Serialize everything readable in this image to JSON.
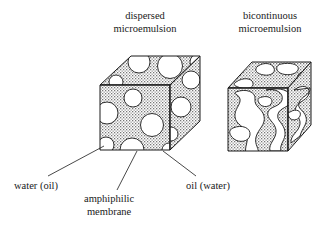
{
  "figure": {
    "background_color": "#ffffff",
    "ink_color": "#1a1a1a",
    "fill_texture": "stipple-dots",
    "fill_color": "#d8d8d8"
  },
  "titles": {
    "left": "dispersed\nmicroemulsion",
    "right": "bicontinuous\nmicroemulsion"
  },
  "labels": {
    "water": "water (oil)",
    "membrane": "amphiphilic\nmembrane",
    "oil": "oil (water)"
  },
  "diagrams": [
    {
      "name": "dispersed-microemulsion-cube",
      "title": "dispersed microemulsion",
      "shape": "cube-isometric",
      "matrix": "stippled continuous phase",
      "inclusions": "white spherical droplets",
      "droplet_count": 13
    },
    {
      "name": "bicontinuous-microemulsion-cube",
      "title": "bicontinuous microemulsion",
      "shape": "cube-isometric",
      "matrix": "stippled continuous phase",
      "inclusions": "white interconnected irregular channels",
      "channel_count": 14
    }
  ],
  "leaders": [
    {
      "label": "water (oil)",
      "points_to": "droplet in lower-left of front face"
    },
    {
      "label": "amphiphilic membrane",
      "points_to": "droplet boundary on front face"
    },
    {
      "label": "oil (water)",
      "points_to": "stippled matrix near front-bottom-right"
    }
  ]
}
